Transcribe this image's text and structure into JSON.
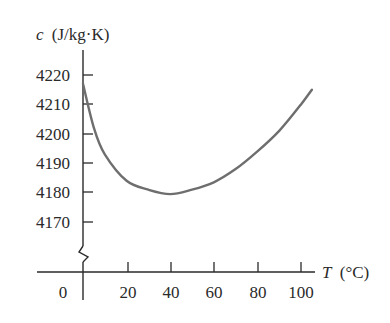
{
  "chart_data": {
    "type": "line",
    "title": "",
    "xlabel": "T (°C)",
    "ylabel": "c (J/kg·K)",
    "xlabel_var": "T",
    "xlabel_unit": "(°C)",
    "ylabel_var": "c",
    "ylabel_unit": "(J/kg·K)",
    "x_ticks": [
      0,
      20,
      40,
      60,
      80,
      100
    ],
    "y_ticks": [
      4170,
      4180,
      4190,
      4200,
      4210,
      4220
    ],
    "xlim": [
      0,
      105
    ],
    "ylim": [
      4160,
      4225
    ],
    "y_axis_break": true,
    "grid": false,
    "legend": null,
    "series": [
      {
        "name": "specific heat of water",
        "x": [
          0,
          5,
          10,
          20,
          30,
          40,
          50,
          60,
          70,
          80,
          90,
          100,
          105
        ],
        "values": [
          4217,
          4202,
          4193,
          4184,
          4181,
          4179.5,
          4181,
          4183.5,
          4188,
          4194,
          4201,
          4210,
          4215
        ]
      }
    ]
  },
  "labels": {
    "y_var": "c",
    "y_unit": "(J/kg·K)",
    "x_var": "T",
    "x_unit": "(°C)",
    "y_ticks": [
      "4220",
      "4210",
      "4200",
      "4190",
      "4180",
      "4170"
    ],
    "x_ticks": [
      "0",
      "20",
      "40",
      "60",
      "80",
      "100"
    ]
  },
  "colors": {
    "axis": "#2a2a2a",
    "curve": "#6e6e6e"
  }
}
